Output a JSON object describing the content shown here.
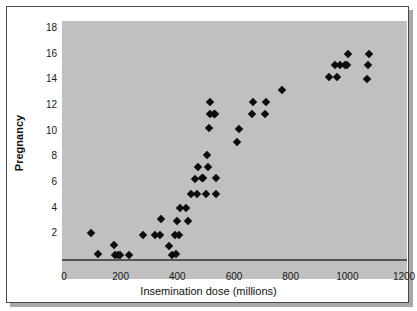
{
  "chart_data": {
    "type": "scatter",
    "title": "",
    "xlabel": "Insemination dose (millions)",
    "ylabel": "Pregnancy",
    "xlim": [
      0,
      1200
    ],
    "ylim": [
      0,
      18
    ],
    "grid": false,
    "legend": null,
    "xticks": [
      0,
      200,
      400,
      600,
      800,
      1000,
      1200
    ],
    "yticks": [
      2,
      4,
      6,
      8,
      10,
      12,
      14,
      16,
      18
    ],
    "xtick_labels": [
      "0",
      "200",
      "400",
      "600",
      "800",
      "1000",
      "1200"
    ],
    "ytick_labels": [
      "2",
      "4",
      "6",
      "8",
      "10",
      "12",
      "14",
      "16",
      "18"
    ],
    "marker": "diamond",
    "marker_color": "#0d0d0d",
    "plot_background": "#c0c0c0",
    "points": [
      {
        "x": 95,
        "y": 2.0
      },
      {
        "x": 120,
        "y": 0.4
      },
      {
        "x": 175,
        "y": 1.1
      },
      {
        "x": 180,
        "y": 0.3
      },
      {
        "x": 192,
        "y": 0.3
      },
      {
        "x": 198,
        "y": 0.3
      },
      {
        "x": 228,
        "y": 0.3
      },
      {
        "x": 280,
        "y": 1.9
      },
      {
        "x": 320,
        "y": 1.9
      },
      {
        "x": 340,
        "y": 1.9
      },
      {
        "x": 343,
        "y": 3.1
      },
      {
        "x": 372,
        "y": 1.0
      },
      {
        "x": 380,
        "y": 0.3
      },
      {
        "x": 392,
        "y": 1.9
      },
      {
        "x": 395,
        "y": 0.4
      },
      {
        "x": 400,
        "y": 3.0
      },
      {
        "x": 405,
        "y": 1.9
      },
      {
        "x": 408,
        "y": 4.0
      },
      {
        "x": 432,
        "y": 4.0
      },
      {
        "x": 438,
        "y": 3.0
      },
      {
        "x": 448,
        "y": 5.1
      },
      {
        "x": 462,
        "y": 6.2
      },
      {
        "x": 470,
        "y": 5.1
      },
      {
        "x": 472,
        "y": 7.2
      },
      {
        "x": 486,
        "y": 6.3
      },
      {
        "x": 492,
        "y": 6.3
      },
      {
        "x": 500,
        "y": 5.1
      },
      {
        "x": 505,
        "y": 8.1
      },
      {
        "x": 508,
        "y": 7.2
      },
      {
        "x": 512,
        "y": 10.2
      },
      {
        "x": 515,
        "y": 11.3
      },
      {
        "x": 516,
        "y": 12.2
      },
      {
        "x": 528,
        "y": 11.3
      },
      {
        "x": 532,
        "y": 11.3
      },
      {
        "x": 535,
        "y": 6.3
      },
      {
        "x": 538,
        "y": 5.1
      },
      {
        "x": 612,
        "y": 9.1
      },
      {
        "x": 618,
        "y": 10.1
      },
      {
        "x": 662,
        "y": 11.3
      },
      {
        "x": 668,
        "y": 12.2
      },
      {
        "x": 708,
        "y": 11.3
      },
      {
        "x": 712,
        "y": 12.2
      },
      {
        "x": 768,
        "y": 13.2
      },
      {
        "x": 935,
        "y": 14.2
      },
      {
        "x": 962,
        "y": 14.2
      },
      {
        "x": 958,
        "y": 15.1
      },
      {
        "x": 975,
        "y": 15.1
      },
      {
        "x": 992,
        "y": 15.1
      },
      {
        "x": 1000,
        "y": 15.1
      },
      {
        "x": 1003,
        "y": 16.0
      },
      {
        "x": 1068,
        "y": 14.0
      },
      {
        "x": 1072,
        "y": 15.1
      },
      {
        "x": 1075,
        "y": 16.0
      }
    ]
  },
  "axes": {
    "x_title": "Insemination dose (millions)",
    "y_title": "Pregnancy"
  }
}
